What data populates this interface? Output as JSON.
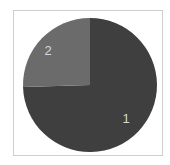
{
  "chart_data": {
    "type": "pie",
    "title": "",
    "categories": [
      "1",
      "2"
    ],
    "values": [
      74.5,
      25.5
    ],
    "colors": [
      "#3f3f3f",
      "#6b6b6b"
    ],
    "labels": [
      "1",
      "2"
    ],
    "legend": "none",
    "start_angle_deg": 0,
    "direction": "clockwise from 12 o'clock for slice 1"
  },
  "labels": {
    "slice1": "1",
    "slice2": "2"
  },
  "colors": {
    "slice1": "#3f3f3f",
    "slice2": "#6b6b6b",
    "frame_border": "#cfcfcf",
    "label": "#d8d8d8"
  }
}
